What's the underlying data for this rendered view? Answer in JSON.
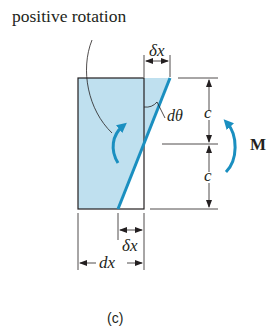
{
  "figure": {
    "annotation": "positive rotation",
    "labels": {
      "delta_x_top": "δx",
      "d_theta": "dθ",
      "c_upper": "c",
      "c_lower": "c",
      "moment": "M",
      "delta_x_bottom": "δx",
      "dx": "dx"
    },
    "caption": "(c)",
    "colors": {
      "fill": "#bfe0ef",
      "accent": "#1a8fc0",
      "ink": "#231f20"
    }
  }
}
